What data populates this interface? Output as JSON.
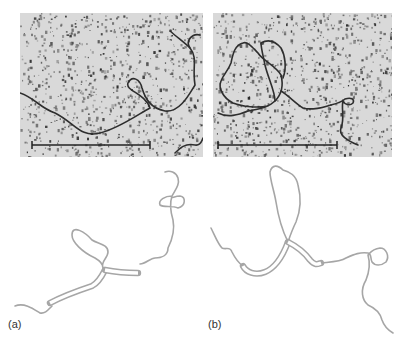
{
  "figure": {
    "panels": [
      {
        "id": "a",
        "label": "(a)",
        "micrograph": {
          "x": 20,
          "y": 13,
          "width": 183,
          "height": 144,
          "background": "#d9d9d9",
          "speckle_color": "#3a3a3a",
          "strand_color": "#2e2e2e",
          "strands": [
            "M0,80 C15,85 20,95 35,100 C55,110 60,125 80,120 C100,115 120,100 130,95 C125,80 105,78 108,70 C112,62 120,66 122,75 C125,85 130,95 145,98 C160,100 170,80 175,72 C172,55 178,45 170,35 C165,28 172,20 180,22",
            "M150,18 C158,25 165,30 170,35",
            "M155,140 C160,135 165,130 175,132 C180,133 182,128 183,125"
          ],
          "scale_bar": {
            "x1": 12,
            "x2": 130,
            "y": 132
          }
        },
        "trace": {
          "stroke_color": "#a6a6a6",
          "single_strands": [
            "M15,306 C25,302 35,310 40,313 C45,314 48,310 52,306",
            "M103,268 C100,262 108,258 108,252 C108,244 98,244 92,240 C85,232 72,224 72,235 C72,242 82,252 95,258 C102,262 103,266 103,268",
            "M140,264 C146,264 150,258 155,258 C162,258 168,255 168,248 C172,240 175,230 173,220 C170,210 170,202 172,196 C165,196 158,200 160,205 C164,208 172,205 178,208 C186,206 186,197 180,196 C174,196 170,200 172,196 C175,190 180,185 178,178 C176,172 170,170 165,172"
          ],
          "double_strands": [
            {
              "path": "M50,303 C65,295 80,290 92,286 C98,283 102,276 105,270",
              "gap": 2.5
            },
            {
              "path": "M105,270 C115,272 125,273 138,273",
              "gap": 2.5
            }
          ]
        }
      },
      {
        "id": "b",
        "label": "(b)",
        "micrograph": {
          "x": 213,
          "y": 13,
          "width": 179,
          "height": 144,
          "background": "#d9d9d9",
          "speckle_color": "#3a3a3a",
          "strand_color": "#2e2e2e",
          "strands": [
            "M5,100 C15,105 25,102 35,98 C45,96 55,95 62,88 C70,80 70,70 68,62 C62,52 50,48 45,40 C40,35 35,28 30,30 C22,32 20,40 18,50 C15,58 10,62 8,68 C5,75 10,85 20,90 C30,94 45,95 55,93",
            "M62,88 C62,78 55,65 52,52 C50,42 48,35 48,30",
            "M48,30 C55,26 62,28 68,35 C72,42 74,55 70,65",
            "M68,78 C75,82 82,90 90,95 C100,98 110,94 118,92",
            "M118,92 C126,90 130,88 132,86 C138,84 142,86 140,90 C137,93 132,92 130,88 C128,95 132,105 128,115 C125,122 135,128 145,132"
          ],
          "scale_bar": {
            "x1": 5,
            "x2": 124,
            "y": 132
          }
        },
        "trace": {
          "stroke_color": "#a6a6a6",
          "single_strands": [
            "M211,228 C215,236 218,244 222,248 C226,250 230,246 232,252 C236,260 240,264 243,266",
            "M288,242 C282,230 278,215 276,202 C274,190 270,180 270,172 C272,164 278,165 283,170 C290,172 296,175 298,185 C302,200 300,212 296,222 C292,230 290,236 288,242",
            "M321,263 C330,262 340,262 346,258 C355,254 360,252 368,253 C372,254 370,258 372,262 C375,266 381,266 386,262 C390,256 386,248 380,248 C372,249 370,253 368,255 C370,262 370,270 366,280 C360,290 362,300 368,305 C375,308 380,312 382,320 C384,326 388,330 393,333"
          ],
          "double_strands": [
            {
              "path": "M243,266 C246,272 255,276 265,272 C275,268 282,258 288,242",
              "gap": 2.5
            },
            {
              "path": "M288,242 C296,246 304,252 310,260 C315,266 318,264 321,263",
              "gap": 2.5
            }
          ]
        }
      }
    ]
  }
}
